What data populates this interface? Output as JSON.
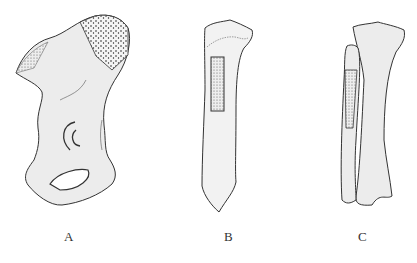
{
  "figure": {
    "panels": [
      {
        "id": "A",
        "label": "A",
        "description": "Pelvic bone (ilium) with stippled graft donor region on iliac crest"
      },
      {
        "id": "B",
        "label": "B",
        "description": "Tibia with rectangular stippled graft region on proximal shaft"
      },
      {
        "id": "C",
        "label": "C",
        "description": "Tibia and fibula with stippled graft region on proximal fibula"
      }
    ],
    "colors": {
      "outline": "#333333",
      "bone_fill": "#ececec",
      "stipple": "#222222",
      "background": "#ffffff"
    }
  }
}
